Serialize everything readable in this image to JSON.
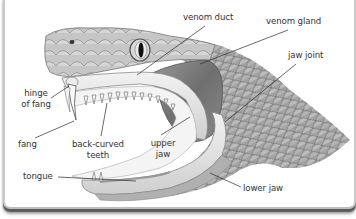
{
  "diagram": {
    "colors": {
      "background": "#ffffff",
      "frame_border": "#c9c9c9",
      "frame_shadow": "#5a5a5a",
      "label_text": "#333333",
      "leader_line": "#2b2b2b",
      "scales": "#9c9c9c",
      "venom_gland": "#7e7e7e",
      "mouth_lining": "#e6e6e6"
    },
    "labels": {
      "venom_duct": "venom duct",
      "venom_gland": "venom gland",
      "jaw_joint": "jaw joint",
      "hinge_of_fang_line1": "hinge",
      "hinge_of_fang_line2": "of fang",
      "fang": "fang",
      "back_curved_teeth_line1": "back-curved",
      "back_curved_teeth_line2": "teeth",
      "upper_jaw_line1": "upper",
      "upper_jaw_line2": "jaw",
      "tongue": "tongue",
      "lower_jaw": "lower jaw"
    }
  }
}
